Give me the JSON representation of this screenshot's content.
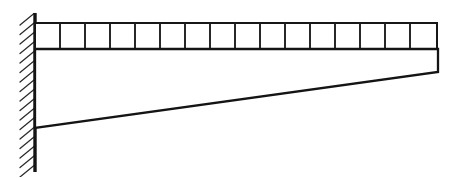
{
  "figure": {
    "title": "Tapered cantilever beam with uniformly distributed load",
    "canvas": {
      "width": 462,
      "height": 177
    },
    "background_color": "#ffffff",
    "ink_color": "#1a1a1a"
  },
  "support": {
    "type": "fixed-wall-support",
    "label": "fixed end",
    "wall_line": {
      "x": 35,
      "y_top": 13,
      "y_bottom": 172
    },
    "hatching": {
      "side": "left",
      "direction": "lower-left-to-upper-right",
      "count": 17,
      "length": 15,
      "spacing": 9.5,
      "color": "#2a2a2a"
    }
  },
  "load": {
    "type": "uniformly-distributed-load",
    "representation": "rectangular-cell-grid",
    "cell_count": 16,
    "grid": {
      "x_start": 35,
      "x_end": 437,
      "y_top": 23,
      "y_bottom": 49
    },
    "divider_positions": [
      60,
      85,
      110,
      135,
      160,
      185,
      210,
      235,
      260,
      285,
      310,
      335,
      360,
      385,
      410
    ],
    "color": "#171717"
  },
  "beam": {
    "type": "tapered-cantilever",
    "top_edge": {
      "x_start": 35,
      "y": 49,
      "x_end": 438
    },
    "right_edge": {
      "x": 438,
      "y_top": 49,
      "y_bottom": 72
    },
    "bottom_edge": {
      "x_start": 35,
      "y_start": 128,
      "x_end": 438,
      "y_end": 72
    },
    "root_depth": 79,
    "tip_depth": 23,
    "span": 403,
    "color": "#141414"
  }
}
